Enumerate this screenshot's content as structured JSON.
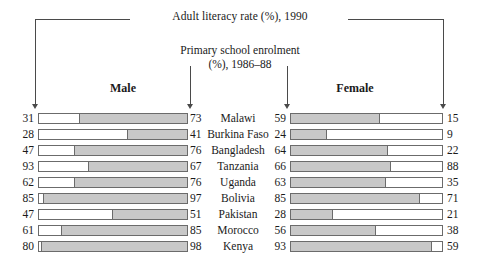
{
  "chart_data": {
    "type": "bar",
    "title": "Adult literacy rate (%), 1990",
    "subtitle": "Primary school enrolment (%), 1986–88",
    "xlabel": "",
    "ylabel": "",
    "xlim": [
      0,
      100
    ],
    "grid": false,
    "legend_position": "none",
    "categories": [
      "Malawi",
      "Burkina Faso",
      "Bangladesh",
      "Tanzania",
      "Uganda",
      "Bolivia",
      "Pakistan",
      "Morocco",
      "Kenya"
    ],
    "series": [
      {
        "name": "Adult literacy rate (%), 1990 — Male",
        "values": [
          31,
          28,
          47,
          93,
          62,
          85,
          47,
          61,
          80
        ]
      },
      {
        "name": "Primary school enrolment (%), 1986–88 — Male",
        "values": [
          73,
          41,
          76,
          67,
          76,
          97,
          51,
          85,
          98
        ]
      },
      {
        "name": "Primary school enrolment (%), 1986–88 — Female",
        "values": [
          59,
          24,
          64,
          66,
          63,
          85,
          28,
          56,
          93
        ]
      },
      {
        "name": "Adult literacy rate (%), 1990 — Female",
        "values": [
          15,
          9,
          22,
          88,
          35,
          71,
          21,
          38,
          59
        ]
      }
    ]
  },
  "header": {
    "literacy_title": "Adult literacy rate (%), 1990",
    "enrolment_title_line1": "Primary school enrolment",
    "enrolment_title_line2": "(%), 1986–88",
    "male_label": "Male",
    "female_label": "Female"
  },
  "colors": {
    "bar_fill": "#c8c8c8",
    "bar_border": "#6b6b6b",
    "background": "#ffffff",
    "text": "#1a1a1a",
    "rule": "#4a4a4a"
  },
  "rows": [
    {
      "male_literacy": "31",
      "male_enrolment": "73",
      "country": "Malawi",
      "female_enrolment": "59",
      "female_literacy": "15",
      "male_enrolment_pct": 73,
      "female_enrolment_pct": 59
    },
    {
      "male_literacy": "28",
      "male_enrolment": "41",
      "country": "Burkina Faso",
      "female_enrolment": "24",
      "female_literacy": "9",
      "male_enrolment_pct": 41,
      "female_enrolment_pct": 24
    },
    {
      "male_literacy": "47",
      "male_enrolment": "76",
      "country": "Bangladesh",
      "female_enrolment": "64",
      "female_literacy": "22",
      "male_enrolment_pct": 76,
      "female_enrolment_pct": 64
    },
    {
      "male_literacy": "93",
      "male_enrolment": "67",
      "country": "Tanzania",
      "female_enrolment": "66",
      "female_literacy": "88",
      "male_enrolment_pct": 67,
      "female_enrolment_pct": 66
    },
    {
      "male_literacy": "62",
      "male_enrolment": "76",
      "country": "Uganda",
      "female_enrolment": "63",
      "female_literacy": "35",
      "male_enrolment_pct": 76,
      "female_enrolment_pct": 63
    },
    {
      "male_literacy": "85",
      "male_enrolment": "97",
      "country": "Bolivia",
      "female_enrolment": "85",
      "female_literacy": "71",
      "male_enrolment_pct": 97,
      "female_enrolment_pct": 85
    },
    {
      "male_literacy": "47",
      "male_enrolment": "51",
      "country": "Pakistan",
      "female_enrolment": "28",
      "female_literacy": "21",
      "male_enrolment_pct": 51,
      "female_enrolment_pct": 28
    },
    {
      "male_literacy": "61",
      "male_enrolment": "85",
      "country": "Morocco",
      "female_enrolment": "56",
      "female_literacy": "38",
      "male_enrolment_pct": 85,
      "female_enrolment_pct": 56
    },
    {
      "male_literacy": "80",
      "male_enrolment": "98",
      "country": "Kenya",
      "female_enrolment": "93",
      "female_literacy": "59",
      "male_enrolment_pct": 98,
      "female_enrolment_pct": 93
    }
  ]
}
